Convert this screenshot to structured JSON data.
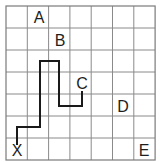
{
  "diagram": {
    "type": "grid-map",
    "grid": {
      "columns": 7,
      "rows": 7,
      "origin_x": 6,
      "origin_y": 6,
      "cell_width": 21.3,
      "cell_height": 22,
      "line_color": "#8a8a8a",
      "background": "#ffffff"
    },
    "labels": [
      {
        "id": "A",
        "text": "A",
        "x": 39,
        "y": 17
      },
      {
        "id": "B",
        "text": "B",
        "x": 60,
        "y": 40
      },
      {
        "id": "C",
        "text": "C",
        "x": 82,
        "y": 83
      },
      {
        "id": "D",
        "text": "D",
        "x": 123,
        "y": 106
      },
      {
        "id": "E",
        "text": "E",
        "x": 144,
        "y": 150
      },
      {
        "id": "X",
        "text": "X",
        "x": 17,
        "y": 150
      }
    ],
    "path": {
      "color": "#1a1a1a",
      "from": "X",
      "to": "C",
      "points": [
        [
          17,
          145
        ],
        [
          17,
          127
        ],
        [
          40,
          127
        ],
        [
          40,
          61
        ],
        [
          59,
          61
        ],
        [
          59,
          106
        ],
        [
          82,
          106
        ],
        [
          82,
          91
        ]
      ]
    }
  }
}
